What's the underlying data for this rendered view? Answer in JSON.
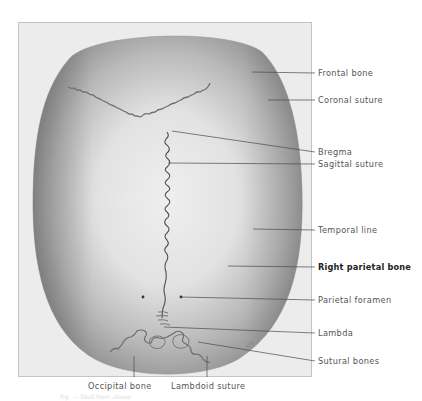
{
  "figure": {
    "right_labels": [
      {
        "id": "frontal-bone",
        "text": "Frontal bone",
        "y": 68,
        "target": [
          252,
          72
        ],
        "bold": false
      },
      {
        "id": "coronal-suture",
        "text": "Coronal suture",
        "y": 95,
        "target": [
          268,
          100
        ],
        "bold": false
      },
      {
        "id": "bregma",
        "text": "Bregma",
        "y": 147,
        "target": [
          172,
          131
        ],
        "bold": false
      },
      {
        "id": "sagittal-suture",
        "text": "Sagittal suture",
        "y": 159,
        "target": [
          168,
          163
        ],
        "bold": false
      },
      {
        "id": "temporal-line",
        "text": "Temporal line",
        "y": 225,
        "target": [
          253,
          229
        ],
        "bold": false
      },
      {
        "id": "right-parietal-bone",
        "text": "Right parietal bone",
        "y": 262,
        "target": [
          228,
          266
        ],
        "bold": true
      },
      {
        "id": "parietal-foramen",
        "text": "Parietal foramen",
        "y": 295,
        "target": [
          181,
          297
        ],
        "bold": false
      },
      {
        "id": "lambda",
        "text": "Lambda",
        "y": 328,
        "target": [
          164,
          327
        ],
        "bold": false
      },
      {
        "id": "sutural-bones",
        "text": "Sutural bones",
        "y": 356,
        "target": [
          198,
          342
        ],
        "bold": false
      }
    ],
    "bottom_labels": [
      {
        "id": "occipital-bone",
        "text": "Occipital bone",
        "x": 88,
        "line_x": 134
      },
      {
        "id": "lambdoid-suture",
        "text": "Lambdoid suture",
        "x": 171,
        "line_x": 207
      }
    ],
    "signature": "YH",
    "caption": "Fig. — Skull from above"
  }
}
